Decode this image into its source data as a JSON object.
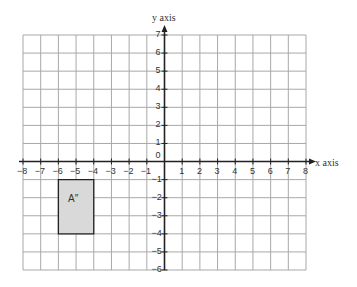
{
  "diagram": {
    "type": "coordinate-grid",
    "x_axis_label": "x axis",
    "y_axis_label": "y axis",
    "x_range": [
      -8,
      8
    ],
    "y_range": [
      -6,
      7
    ],
    "x_ticks": [
      "-8",
      "-7",
      "-6",
      "-5",
      "-4",
      "-3",
      "-2",
      "-1",
      "1",
      "2",
      "3",
      "4",
      "5",
      "6",
      "7",
      "8"
    ],
    "y_ticks": [
      "7",
      "6",
      "5",
      "4",
      "3",
      "2",
      "1",
      "-1",
      "-2",
      "-3",
      "-4",
      "-5",
      "-6"
    ],
    "origin_label": "0",
    "shapes": [
      {
        "name": "A''",
        "label": "A″",
        "type": "rectangle",
        "vertices": [
          [
            -6,
            -1
          ],
          [
            -4,
            -1
          ],
          [
            -4,
            -4
          ],
          [
            -6,
            -4
          ]
        ],
        "fill": "#d9d9d9",
        "stroke": "#222222"
      }
    ]
  },
  "colors": {
    "grid": "#a8a8a8",
    "axis": "#222222",
    "background": "#ffffff"
  }
}
